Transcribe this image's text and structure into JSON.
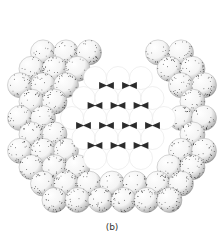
{
  "figure": {
    "caption": "(b)",
    "face_description": "central close-packed (111) face with triangular interstitial voids",
    "colors": {
      "sphere_fill": "#ffffff",
      "stipple": "#1a1a1a",
      "void": "#2b2b2b",
      "outline": "#9a9a9a"
    }
  }
}
